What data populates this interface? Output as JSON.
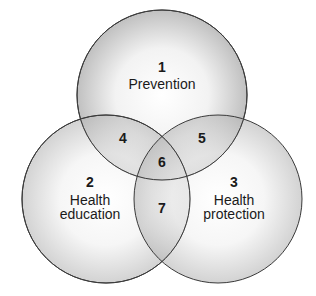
{
  "diagram": {
    "type": "venn",
    "circles": [
      {
        "id": 1,
        "number": "1",
        "label_lines": [
          "Prevention"
        ],
        "cx": 162,
        "cy": 95,
        "r": 85
      },
      {
        "id": 2,
        "number": "2",
        "label_lines": [
          "Health",
          "education"
        ],
        "cx": 106,
        "cy": 199,
        "r": 84
      },
      {
        "id": 3,
        "number": "3",
        "label_lines": [
          "Health",
          "protection"
        ],
        "cx": 218,
        "cy": 199,
        "r": 84
      }
    ],
    "intersections": [
      {
        "number": "4",
        "between": [
          1,
          2
        ]
      },
      {
        "number": "5",
        "between": [
          1,
          3
        ]
      },
      {
        "number": "6",
        "between": [
          1,
          2,
          3
        ]
      },
      {
        "number": "7",
        "between": [
          2,
          3
        ]
      }
    ],
    "colors": {
      "stroke": "#3a3a3a",
      "fill_center": "#ffffff",
      "fill_edge": "#b8b8b8",
      "overlap_tint": "#8c8c8c"
    }
  }
}
